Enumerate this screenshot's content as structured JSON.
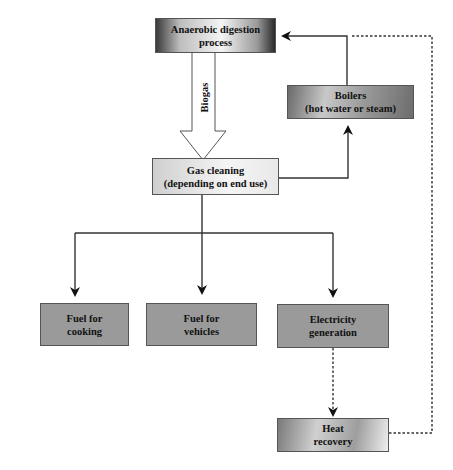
{
  "diagram": {
    "nodes": [
      {
        "id": "anaerobic",
        "label_line1": "Anaerobic digestion",
        "label_line2": "process"
      },
      {
        "id": "boilers",
        "label_line1": "Boilers",
        "label_line2": "(hot water or steam)"
      },
      {
        "id": "gas_cleaning",
        "label_line1": "Gas cleaning",
        "label_line2": "(depending on end use)"
      },
      {
        "id": "fuel_cooking",
        "label_line1": "Fuel for",
        "label_line2": "cooking"
      },
      {
        "id": "fuel_vehicles",
        "label_line1": "Fuel for",
        "label_line2": "vehicles"
      },
      {
        "id": "electricity",
        "label_line1": "Electricity",
        "label_line2": "generation"
      },
      {
        "id": "heat_recovery",
        "label_line1": "Heat",
        "label_line2": "recovery"
      }
    ],
    "edges": [
      {
        "from": "anaerobic",
        "to": "gas_cleaning",
        "style": "hollow-arrow",
        "label": "Biogas"
      },
      {
        "from": "gas_cleaning",
        "to": "boilers",
        "style": "solid"
      },
      {
        "from": "boilers",
        "to": "anaerobic",
        "style": "solid"
      },
      {
        "from": "gas_cleaning",
        "to": "fuel_cooking",
        "style": "solid"
      },
      {
        "from": "gas_cleaning",
        "to": "fuel_vehicles",
        "style": "solid"
      },
      {
        "from": "gas_cleaning",
        "to": "electricity",
        "style": "solid"
      },
      {
        "from": "electricity",
        "to": "heat_recovery",
        "style": "dotted"
      },
      {
        "from": "heat_recovery",
        "to": "anaerobic",
        "style": "dotted"
      }
    ],
    "biogas_label": "Biogas"
  }
}
